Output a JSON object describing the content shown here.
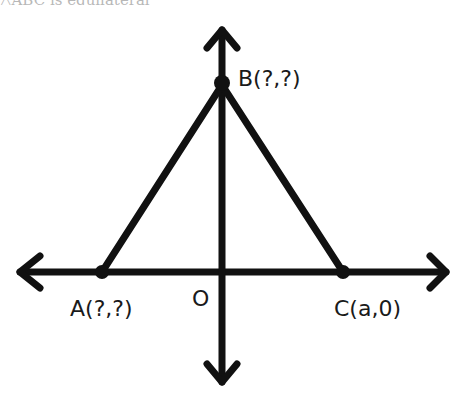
{
  "caption": "△ABC is equilateral",
  "diagram": {
    "type": "coordinate-plane-triangle",
    "colors": {
      "stroke": "#111111",
      "background": "#ffffff"
    },
    "origin_label": "O",
    "points": [
      {
        "id": "A",
        "label": "A(?,?)"
      },
      {
        "id": "B",
        "label": "B(?,?)"
      },
      {
        "id": "C",
        "label": "C(a,0)"
      }
    ],
    "segments": [
      "AB",
      "BC",
      "AC"
    ],
    "axes": [
      "x-axis (double arrow)",
      "y-axis (double arrow)"
    ]
  }
}
